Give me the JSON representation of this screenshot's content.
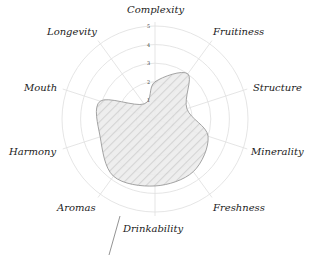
{
  "chart_data": {
    "type": "radar",
    "title": "",
    "categories": [
      "Complexity",
      "Fruitiness",
      "Structure",
      "Minerality",
      "Freshness",
      "Drinkability",
      "Aromas",
      "Harmony",
      "Mouth",
      "Longevity"
    ],
    "series": [
      {
        "name": "Wine profile",
        "values": [
          2.0,
          3.0,
          1.8,
          3.0,
          3.5,
          3.6,
          3.8,
          3.1,
          3.1,
          1.0
        ]
      }
    ],
    "rlim": [
      0,
      5
    ],
    "ticks": [
      "1",
      "2",
      "3",
      "4",
      "5"
    ],
    "grid": true,
    "legend": "none",
    "colors": {
      "fill": "#d8d8d8",
      "stroke": "#9a9a9a",
      "grid": "#e2e2e2",
      "hatch": "#c4c4c4"
    }
  },
  "labels": {
    "complexity": "Complexity",
    "fruitiness": "Fruitiness",
    "structure": "Structure",
    "minerality": "Minerality",
    "freshness": "Freshness",
    "drinkability": "Drinkability",
    "aromas": "Aromas",
    "harmony": "Harmony",
    "mouth": "Mouth",
    "longevity": "Longevity"
  },
  "ticks": {
    "t1": "1",
    "t2": "2",
    "t3": "3",
    "t4": "4",
    "t5": "5"
  }
}
